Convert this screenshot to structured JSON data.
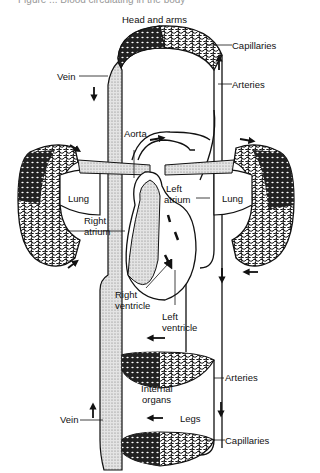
{
  "figure": {
    "caption_partial": "Figure ... Blood circulating in the body",
    "colors": {
      "ink": "#111111",
      "paper": "#ffffff",
      "stipple": "#bdbdbd"
    }
  },
  "labels": {
    "head_and_arms": "Head and arms",
    "capillaries_top": "Capillaries",
    "arteries_top": "Arteries",
    "vein_top": "Vein",
    "aorta": "Aorta",
    "lung_left": "Lung",
    "lung_right": "Lung",
    "left_atrium_1": "Left",
    "left_atrium_2": "atrium",
    "right_atrium_1": "Right",
    "right_atrium_2": "atrium",
    "right_ventricle_1": "Right",
    "right_ventricle_2": "ventricle",
    "left_ventricle_1": "Left",
    "left_ventricle_2": "ventricle",
    "internal_organs_1": "Internal",
    "internal_organs_2": "organs",
    "arteries_bottom": "Arteries",
    "legs": "Legs",
    "vein_bottom": "Vein",
    "capillaries_bottom": "Capillaries"
  },
  "arrows": [
    {
      "id": "vein-top-down",
      "dir": "down"
    },
    {
      "id": "arteries-top-up",
      "dir": "up"
    },
    {
      "id": "aorta-right",
      "dir": "right"
    },
    {
      "id": "lung-left-up",
      "dir": "up-right"
    },
    {
      "id": "lung-left-low",
      "dir": "up-right"
    },
    {
      "id": "lung-right-top",
      "dir": "right"
    },
    {
      "id": "lung-right-bottom",
      "dir": "left"
    },
    {
      "id": "right-down",
      "dir": "down"
    },
    {
      "id": "organs-left",
      "dir": "left"
    },
    {
      "id": "legs-left",
      "dir": "left"
    },
    {
      "id": "vein-bottom-up",
      "dir": "up"
    },
    {
      "id": "arteries-bottom-down",
      "dir": "down"
    }
  ]
}
